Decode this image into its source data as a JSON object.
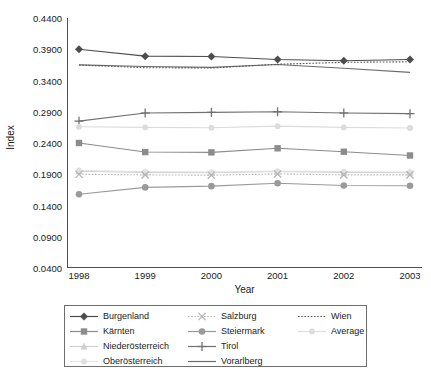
{
  "chart_data": {
    "type": "line",
    "title": "",
    "xlabel": "Year",
    "ylabel": "Index",
    "categories": [
      "1998",
      "1999",
      "2000",
      "2001",
      "2002",
      "2003"
    ],
    "x": [
      1998,
      1999,
      2000,
      2001,
      2002,
      2003
    ],
    "ylim": [
      0.04,
      0.44
    ],
    "ytick_labels": [
      "0.0400",
      "0.0900",
      "0.1400",
      "0.1900",
      "0.2400",
      "0.2900",
      "0.3400",
      "0.3900",
      "0.4400"
    ],
    "ytick_values": [
      0.04,
      0.09,
      0.14,
      0.19,
      0.24,
      0.29,
      0.34,
      0.39,
      0.44
    ],
    "grid": false,
    "legend_position": "bottom",
    "series": [
      {
        "name": "Burgenland",
        "values": [
          0.39,
          0.379,
          0.3785,
          0.3735,
          0.3715,
          0.3735
        ],
        "color": "#4d4d4d",
        "marker": "diamond",
        "dash": "solid"
      },
      {
        "name": "Kärnten",
        "values": [
          0.24,
          0.2255,
          0.225,
          0.2315,
          0.226,
          0.22
        ],
        "color": "#8c8c8c",
        "marker": "square",
        "dash": "solid"
      },
      {
        "name": "Niederösterreich",
        "values": [
          0.195,
          0.193,
          0.1925,
          0.1945,
          0.193,
          0.1925
        ],
        "color": "#cfcfcf",
        "marker": "triangle",
        "dash": "solid"
      },
      {
        "name": "Oberösterreich",
        "values": [
          0.196,
          0.194,
          0.1935,
          0.195,
          0.194,
          0.1935
        ],
        "color": "#e0e0e0",
        "marker": "circle-small",
        "dash": "solid"
      },
      {
        "name": "Salzburg",
        "values": [
          0.19,
          0.189,
          0.1885,
          0.1905,
          0.189,
          0.189
        ],
        "color": "#b5b5b5",
        "marker": "x",
        "dash": "dotted"
      },
      {
        "name": "Steiermark",
        "values": [
          0.158,
          0.169,
          0.171,
          0.1755,
          0.172,
          0.1715
        ],
        "color": "#9a9a9a",
        "marker": "circle",
        "dash": "solid"
      },
      {
        "name": "Tirol",
        "values": [
          0.275,
          0.288,
          0.289,
          0.29,
          0.288,
          0.287
        ],
        "color": "#707070",
        "marker": "plus",
        "dash": "solid"
      },
      {
        "name": "Vorarlberg",
        "values": [
          0.365,
          0.3625,
          0.361,
          0.3655,
          0.3595,
          0.353
        ],
        "color": "#6b6b6b",
        "marker": "none",
        "dash": "solid"
      },
      {
        "name": "Wien",
        "values": [
          0.3648,
          0.3605,
          0.36,
          0.366,
          0.369,
          0.37
        ],
        "color": "#555555",
        "marker": "none",
        "dash": "dotted"
      },
      {
        "name": "Average",
        "values": [
          0.266,
          0.265,
          0.2645,
          0.267,
          0.265,
          0.264
        ],
        "color": "#dcdcdc",
        "marker": "circle-small",
        "dash": "solid"
      }
    ]
  },
  "axes": {
    "x_title": "Year",
    "y_title": "Index"
  },
  "legend": {
    "items": [
      {
        "label": "Burgenland",
        "series_index": 0
      },
      {
        "label": "Salzburg",
        "series_index": 4
      },
      {
        "label": "Wien",
        "series_index": 8
      },
      {
        "label": "Kärnten",
        "series_index": 1
      },
      {
        "label": "Steiermark",
        "series_index": 5
      },
      {
        "label": "Average",
        "series_index": 9
      },
      {
        "label": "Niederösterreich",
        "series_index": 2
      },
      {
        "label": "Tirol",
        "series_index": 6
      },
      {
        "label": "",
        "series_index": -1
      },
      {
        "label": "Oberösterreich",
        "series_index": 3
      },
      {
        "label": "Vorarlberg",
        "series_index": 7
      },
      {
        "label": "",
        "series_index": -1
      }
    ]
  }
}
